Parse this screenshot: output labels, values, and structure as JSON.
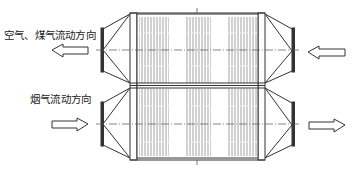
{
  "diagram": {
    "type": "plate heat exchanger flow schematic",
    "labels": {
      "upper_flow": "空气、煤气流动方向",
      "lower_flow": "烟气流动方向"
    },
    "arrows": [
      {
        "id": "upper-left-arrow",
        "direction": "left",
        "meaning": "air/gas outflow"
      },
      {
        "id": "lower-left-arrow",
        "direction": "right",
        "meaning": "flue gas inflow"
      },
      {
        "id": "upper-right-arrow",
        "direction": "left",
        "meaning": "air/gas inflow"
      },
      {
        "id": "lower-right-arrow",
        "direction": "right",
        "meaning": "flue gas outflow"
      }
    ],
    "components": [
      "left-inlet-hood-upper",
      "left-inlet-hood-lower",
      "heat-exchanger-core",
      "middle-partition",
      "right-inlet-hood-upper",
      "right-inlet-hood-lower"
    ],
    "colors": {
      "line": "#333333",
      "fin": "#8a8a8a",
      "background": "#ffffff"
    }
  }
}
